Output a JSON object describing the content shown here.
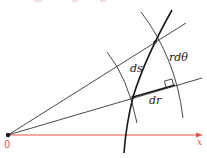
{
  "diagram": {
    "labels": {
      "ds": "ds",
      "dr": "dr",
      "rdtheta": "rdθ",
      "x_axis": "x",
      "origin": "0"
    },
    "colors": {
      "axis": "#e0564f",
      "ink": "#1a1a1a",
      "background": "#ffffff"
    },
    "points": {
      "origin": [
        8,
        135
      ],
      "upper_intersection": [
        155,
        42
      ],
      "lower_intersection": [
        133,
        97
      ],
      "right_angle_corner": [
        175,
        85
      ]
    }
  }
}
